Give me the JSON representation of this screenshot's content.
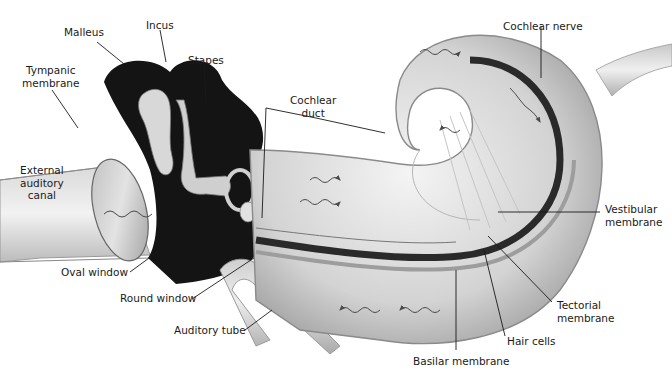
{
  "figure": {
    "colors": {
      "background": "#ffffff",
      "ink": "#1a1a1a",
      "dark_cavity": "#141414",
      "tissue_light": "#e6e6e6",
      "tissue_mid": "#bdbdbd",
      "tissue_dark": "#6e6e6e",
      "wave_arrow": "#4a4a4a"
    },
    "caption_visible": false
  },
  "labels": {
    "malleus": "Malleus",
    "incus": "Incus",
    "stapes": "Stapes",
    "tympanic_membrane": "Tympanic\nmembrane",
    "external_auditory_canal": "External\nauditory\ncanal",
    "oval_window": "Oval window",
    "round_window": "Round window",
    "auditory_tube": "Auditory tube",
    "cochlear_duct": "Cochlear\nduct",
    "cochlear_nerve": "Cochlear nerve",
    "vestibular_membrane": "Vestibular\nmembrane",
    "tectorial_membrane": "Tectorial\nmembrane",
    "hair_cells": "Hair cells",
    "basilar_membrane": "Basilar membrane"
  }
}
